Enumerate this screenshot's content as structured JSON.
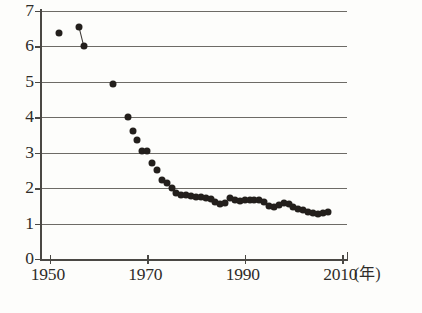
{
  "axes": {
    "y_labels": [
      "7",
      "6",
      "5",
      "4",
      "3",
      "2",
      "1",
      "0"
    ],
    "y_values": [
      7,
      6,
      5,
      4,
      3,
      2,
      1,
      0
    ],
    "x_labels": [
      "1950",
      "1970",
      "1990",
      "2010"
    ],
    "x_values": [
      1950,
      1970,
      1990,
      2010
    ],
    "x_unit_label": "(年)"
  },
  "colors": {
    "marker": "#231f1c",
    "gridline": "#6d6b66",
    "axis": "#4a4844",
    "background": "#fdfdfb"
  },
  "chart_data": {
    "type": "scatter",
    "title": "",
    "xlabel": "(年)",
    "ylabel": "",
    "xlim": [
      1948,
      2011
    ],
    "ylim": [
      0,
      7
    ],
    "grid": true,
    "legend": "none",
    "x": [
      1952,
      1956,
      1957,
      1963,
      1966,
      1967,
      1968,
      1969,
      1970,
      1971,
      1972,
      1973,
      1974,
      1975,
      1976,
      1977,
      1978,
      1979,
      1980,
      1981,
      1982,
      1983,
      1984,
      1985,
      1986,
      1987,
      1988,
      1989,
      1990,
      1991,
      1992,
      1993,
      1994,
      1995,
      1996,
      1997,
      1998,
      1999,
      2000,
      2001,
      2002,
      2003,
      2004,
      2005,
      2006,
      2007
    ],
    "y": [
      6.38,
      6.55,
      6.0,
      4.95,
      4.0,
      3.6,
      3.35,
      3.05,
      3.05,
      2.72,
      2.5,
      2.22,
      2.14,
      2.0,
      1.85,
      1.82,
      1.8,
      1.78,
      1.75,
      1.74,
      1.72,
      1.68,
      1.62,
      1.55,
      1.58,
      1.72,
      1.66,
      1.63,
      1.66,
      1.66,
      1.66,
      1.66,
      1.62,
      1.5,
      1.48,
      1.52,
      1.58,
      1.55,
      1.48,
      1.42,
      1.38,
      1.33,
      1.3,
      1.26,
      1.3,
      1.32
    ],
    "connector_segments": [
      {
        "x1": 1956,
        "y1": 6.55,
        "x2": 1957,
        "y2": 6.0
      }
    ]
  }
}
